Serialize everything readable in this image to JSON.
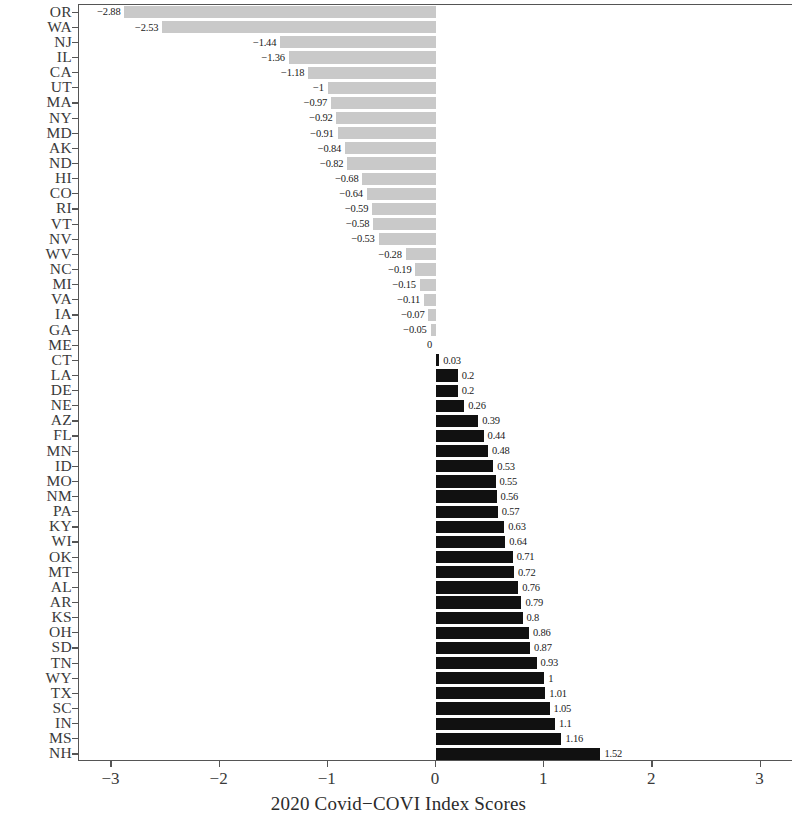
{
  "chart_data": {
    "type": "bar",
    "orientation": "horizontal",
    "title": "",
    "xlabel": "2020 Covid−COVI Index Scores",
    "ylabel": "",
    "xlim": [
      -3.3,
      3.3
    ],
    "xticks": [
      -3,
      -2,
      -1,
      0,
      1,
      2,
      3
    ],
    "xtick_labels": [
      "−3",
      "−2",
      "−1",
      "0",
      "1",
      "2",
      "3"
    ],
    "grid": false,
    "legend": null,
    "sorted": "ascending",
    "colors": {
      "negative_bar": "#c9c9c9",
      "positive_bar": "#111111",
      "axis": "#555555",
      "text": "#2b2b2b"
    },
    "categories": [
      "OR",
      "WA",
      "NJ",
      "IL",
      "CA",
      "UT",
      "MA",
      "NY",
      "MD",
      "AK",
      "ND",
      "HI",
      "CO",
      "RI",
      "VT",
      "NV",
      "WV",
      "NC",
      "MI",
      "VA",
      "IA",
      "GA",
      "ME",
      "CT",
      "LA",
      "DE",
      "NE",
      "AZ",
      "FL",
      "MN",
      "ID",
      "MO",
      "NM",
      "PA",
      "KY",
      "WI",
      "OK",
      "MT",
      "AL",
      "AR",
      "KS",
      "OH",
      "SD",
      "TN",
      "WY",
      "TX",
      "SC",
      "IN",
      "MS",
      "NH"
    ],
    "values": [
      -2.88,
      -2.53,
      -1.44,
      -1.36,
      -1.18,
      -1,
      -0.97,
      -0.92,
      -0.91,
      -0.84,
      -0.82,
      -0.68,
      -0.64,
      -0.59,
      -0.58,
      -0.53,
      -0.28,
      -0.19,
      -0.15,
      -0.11,
      -0.07,
      -0.05,
      0,
      0.03,
      0.2,
      0.2,
      0.26,
      0.39,
      0.44,
      0.48,
      0.53,
      0.55,
      0.56,
      0.57,
      0.63,
      0.64,
      0.71,
      0.72,
      0.76,
      0.79,
      0.8,
      0.86,
      0.87,
      0.93,
      1,
      1.01,
      1.05,
      1.1,
      1.16,
      1.52
    ],
    "value_labels": [
      "−2.88",
      "−2.53",
      "−1.44",
      "−1.36",
      "−1.18",
      "−1",
      "−0.97",
      "−0.92",
      "−0.91",
      "−0.84",
      "−0.82",
      "−0.68",
      "−0.64",
      "−0.59",
      "−0.58",
      "−0.53",
      "−0.28",
      "−0.19",
      "−0.15",
      "−0.11",
      "−0.07",
      "−0.05",
      "0",
      "0.03",
      "0.2",
      "0.2",
      "0.26",
      "0.39",
      "0.44",
      "0.48",
      "0.53",
      "0.55",
      "0.56",
      "0.57",
      "0.63",
      "0.64",
      "0.71",
      "0.72",
      "0.76",
      "0.79",
      "0.8",
      "0.86",
      "0.87",
      "0.93",
      "1",
      "1.01",
      "1.05",
      "1.1",
      "1.16",
      "1.52"
    ]
  }
}
